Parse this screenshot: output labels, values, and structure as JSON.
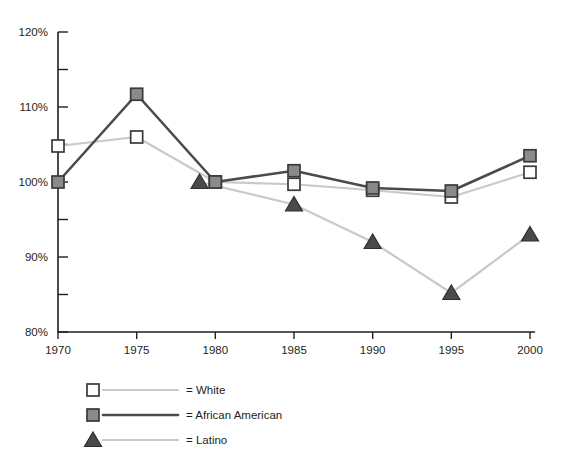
{
  "chart_data": {
    "type": "line",
    "title": "",
    "subtitle": "",
    "xlabel": "",
    "ylabel": "",
    "x": [
      1970,
      1975,
      1980,
      1985,
      1990,
      1995,
      2000
    ],
    "xlim": [
      1970,
      2000
    ],
    "ylim": [
      80,
      120
    ],
    "y_tick_labels": [
      "120%",
      "110%",
      "100%",
      "90%",
      "80%"
    ],
    "y_ticks_major": [
      120,
      110,
      100,
      90,
      80
    ],
    "y_ticks_minor": [
      115,
      105,
      95,
      85
    ],
    "x_tick_labels": [
      "1970",
      "1975",
      "1980",
      "1985",
      "1990",
      "1995",
      "2000"
    ],
    "grid": false,
    "legend_position": "bottom-left",
    "series": [
      {
        "name": "White",
        "legend_label": "= White",
        "marker": "open-square",
        "line_color": "#c9c9c9",
        "marker_fill": "#fdfdfd",
        "marker_stroke": "#3a3a3a",
        "x": [
          1970,
          1975,
          1980,
          1985,
          1990,
          1995,
          2000
        ],
        "values": [
          104.8,
          106.0,
          100.0,
          99.7,
          98.9,
          98.0,
          101.3
        ]
      },
      {
        "name": "African American",
        "legend_label": "= African American",
        "marker": "filled-square",
        "line_color": "#4b4b4b",
        "marker_fill": "#8a8a8a",
        "marker_stroke": "#3a3a3a",
        "x": [
          1970,
          1975,
          1980,
          1985,
          1990,
          1995,
          2000
        ],
        "values": [
          100.0,
          111.7,
          100.0,
          101.5,
          99.2,
          98.8,
          103.5
        ]
      },
      {
        "name": "Latino",
        "legend_label": "= Latino",
        "marker": "triangle",
        "line_color": "#c9c9c9",
        "marker_fill": "#4a4a4a",
        "marker_stroke": "#2e2e2e",
        "x": [
          1979,
          1985,
          1990,
          1995,
          2000
        ],
        "values": [
          100.0,
          97.0,
          92.0,
          85.2,
          93.0
        ]
      }
    ]
  },
  "axis": {
    "y_labels": [
      "120%",
      "110%",
      "100%",
      "90%",
      "80%"
    ],
    "x_labels": [
      "1970",
      "1975",
      "1980",
      "1985",
      "1990",
      "1995",
      "2000"
    ]
  },
  "legend": {
    "entries": [
      {
        "label": "= White",
        "marker": "open-square"
      },
      {
        "label": "= African American",
        "marker": "filled-square"
      },
      {
        "label": "= Latino",
        "marker": "triangle"
      }
    ]
  },
  "colors": {
    "light_line": "#c9c9c9",
    "dark_line": "#4b4b4b",
    "marker_fill_gray": "#8a8a8a",
    "marker_fill_white": "#fdfdfd",
    "marker_stroke": "#3a3a3a",
    "text": "#231f20",
    "background": "#ffffff"
  }
}
